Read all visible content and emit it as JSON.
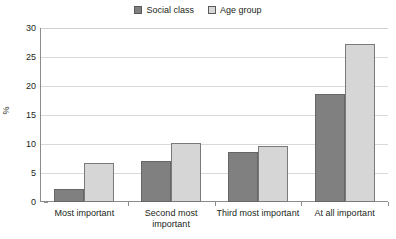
{
  "chart_data": {
    "type": "bar",
    "title": "",
    "subtitle": "",
    "xlabel": "",
    "ylabel": "%",
    "ylim": [
      0,
      30
    ],
    "ytick_step": 5,
    "yticks": [
      30,
      25,
      20,
      15,
      10,
      5,
      0
    ],
    "grid": true,
    "legend_position": "top-center",
    "categories": [
      "Most important",
      "Second most important",
      "Third most important",
      "At all important"
    ],
    "series": [
      {
        "name": "Social class",
        "color": "#808080",
        "values": [
          2.3,
          7.1,
          8.7,
          18.6
        ]
      },
      {
        "name": "Age group",
        "color": "#d6d6d6",
        "values": [
          6.8,
          10.2,
          9.6,
          27.3
        ]
      }
    ]
  },
  "legend": {
    "entries": [
      {
        "label": "Social class",
        "swatch": "filled-dark-square-icon"
      },
      {
        "label": "Age group",
        "swatch": "filled-light-square-icon"
      }
    ]
  },
  "axes": {
    "y_title": "%",
    "y_tick_labels": [
      "30",
      "25",
      "20",
      "15",
      "10",
      "5",
      "0"
    ],
    "x_tick_labels": [
      "Most important",
      "Second most important",
      "Third most important",
      "At all important"
    ]
  }
}
